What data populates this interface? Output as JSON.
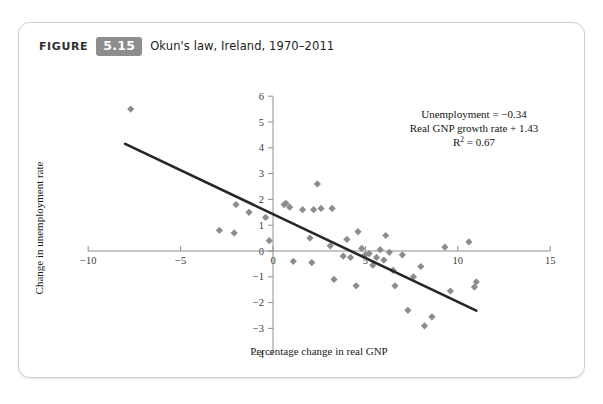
{
  "figure": {
    "label_word": "FIGURE",
    "number": "5.15",
    "caption": "Okun's law, Ireland, 1970–2011"
  },
  "chart_data": {
    "type": "scatter",
    "title": "Okun's law, Ireland, 1970–2011",
    "xlabel": "Percentage change in real GNP",
    "ylabel": "Change in unemployment rate",
    "xlim": [
      -11.5,
      15.6
    ],
    "ylim": [
      -4,
      6
    ],
    "xticks": [
      -10,
      -5,
      0,
      5,
      10,
      15
    ],
    "xtick_labels": [
      "−10",
      "−5",
      "0",
      "5",
      "10",
      "15"
    ],
    "yticks": [
      -4,
      -3,
      -2,
      -1,
      0,
      1,
      2,
      3,
      4,
      5,
      6
    ],
    "ytick_labels": [
      "−4",
      "−3",
      "−2",
      "−1",
      "0",
      "1",
      "2",
      "3",
      "4",
      "5",
      "6"
    ],
    "grid": false,
    "legend": null,
    "marker": "diamond",
    "marker_color": "#8c8c8c",
    "line_color": "#262626",
    "axis_color": "#8e8e8e",
    "points": [
      {
        "x": -7.7,
        "y": 5.5
      },
      {
        "x": -2.0,
        "y": 1.8
      },
      {
        "x": -1.3,
        "y": 1.5
      },
      {
        "x": -2.9,
        "y": 0.8
      },
      {
        "x": -2.1,
        "y": 0.7
      },
      {
        "x": -0.4,
        "y": 1.3
      },
      {
        "x": -0.2,
        "y": 0.4
      },
      {
        "x": 0.6,
        "y": 1.8
      },
      {
        "x": 0.7,
        "y": 1.85
      },
      {
        "x": 0.9,
        "y": 1.7
      },
      {
        "x": 1.1,
        "y": -0.4
      },
      {
        "x": 1.6,
        "y": 1.6
      },
      {
        "x": 2.2,
        "y": 1.6
      },
      {
        "x": 2.4,
        "y": 2.6
      },
      {
        "x": 2.6,
        "y": 1.65
      },
      {
        "x": 3.2,
        "y": 1.65
      },
      {
        "x": 2.0,
        "y": 0.5
      },
      {
        "x": 2.1,
        "y": -0.45
      },
      {
        "x": 3.1,
        "y": 0.2
      },
      {
        "x": 3.3,
        "y": -1.1
      },
      {
        "x": 3.8,
        "y": -0.2
      },
      {
        "x": 4.0,
        "y": 0.45
      },
      {
        "x": 4.2,
        "y": -0.25
      },
      {
        "x": 4.5,
        "y": -1.35
      },
      {
        "x": 4.6,
        "y": 0.75
      },
      {
        "x": 4.8,
        "y": 0.1
      },
      {
        "x": 5.0,
        "y": -0.15
      },
      {
        "x": 5.2,
        "y": -0.1
      },
      {
        "x": 5.4,
        "y": -0.55
      },
      {
        "x": 5.6,
        "y": -0.25
      },
      {
        "x": 5.8,
        "y": 0.05
      },
      {
        "x": 6.0,
        "y": -0.35
      },
      {
        "x": 6.1,
        "y": 0.6
      },
      {
        "x": 6.3,
        "y": -0.05
      },
      {
        "x": 6.5,
        "y": -0.75
      },
      {
        "x": 6.6,
        "y": -1.35
      },
      {
        "x": 7.0,
        "y": -0.15
      },
      {
        "x": 7.3,
        "y": -2.3
      },
      {
        "x": 7.6,
        "y": -1.0
      },
      {
        "x": 8.0,
        "y": -0.6
      },
      {
        "x": 8.2,
        "y": -2.9
      },
      {
        "x": 8.6,
        "y": -2.55
      },
      {
        "x": 9.3,
        "y": 0.15
      },
      {
        "x": 9.6,
        "y": -1.55
      },
      {
        "x": 10.6,
        "y": 0.35
      },
      {
        "x": 10.9,
        "y": -1.4
      },
      {
        "x": 11.0,
        "y": -1.2
      }
    ],
    "trendline": {
      "slope": -0.34,
      "intercept": 1.43,
      "x_start": -8.0,
      "x_end": 11.0
    },
    "annotation": {
      "line1": "Unemployment = −0.34",
      "line2": "Real GNP growth rate + 1.43",
      "line3_prefix": "R",
      "line3_sup": "2",
      "line3_suffix": " = 0.67"
    }
  }
}
